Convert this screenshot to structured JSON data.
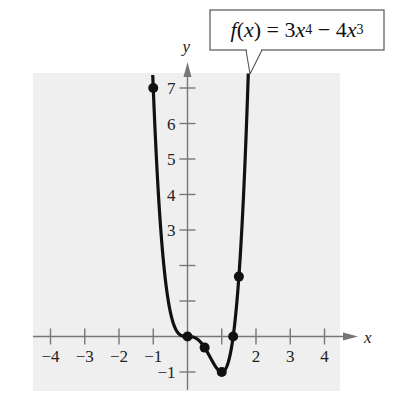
{
  "chart_data": {
    "type": "line",
    "title": "",
    "function_label": {
      "name": "f",
      "var": "x",
      "coef1": "3",
      "exp1": "4",
      "op": "−",
      "coef2": "4",
      "exp2": "3"
    },
    "xlabel": "x",
    "ylabel": "y",
    "xlim": [
      -4.5,
      4.5
    ],
    "ylim": [
      -1.5,
      7.5
    ],
    "x_ticks": [
      -4,
      -3,
      -2,
      -1,
      1,
      2,
      3,
      4
    ],
    "x_tick_labels": [
      "−4",
      "−3",
      "−2",
      "−1",
      "",
      "2",
      "3",
      "4"
    ],
    "y_ticks": [
      -1,
      1,
      2,
      3,
      4,
      5,
      6,
      7
    ],
    "y_tick_labels": [
      "−1",
      "",
      "",
      "3",
      "4",
      "5",
      "6",
      "7"
    ],
    "grid": false,
    "background": "#efefef",
    "series": [
      {
        "name": "f(x) = 3x^4 − 4x^3",
        "color": "#111111",
        "points": [
          {
            "x": -1,
            "y": 7
          },
          {
            "x": 0,
            "y": 0
          },
          {
            "x": 0.5,
            "y": -0.3125
          },
          {
            "x": 1,
            "y": -1
          },
          {
            "x": 1.333,
            "y": 0
          },
          {
            "x": 1.5,
            "y": 1.6875
          }
        ]
      }
    ]
  }
}
